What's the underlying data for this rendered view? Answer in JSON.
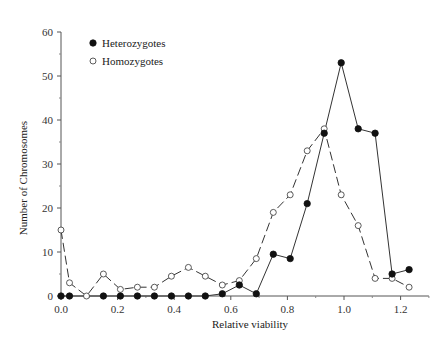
{
  "chart_data": {
    "type": "line",
    "title": "",
    "xlabel": "Relative viability",
    "ylabel": "Number of Chromosomes",
    "xlim": [
      0.0,
      1.3
    ],
    "ylim": [
      0,
      60
    ],
    "x_ticks": [
      0.0,
      0.2,
      0.4,
      0.6,
      0.8,
      1.0,
      1.2
    ],
    "x_tick_labels": [
      "0.0",
      "0.2",
      "0.4",
      "0.6",
      "0.8",
      "1.0",
      "1.2"
    ],
    "y_ticks": [
      0,
      10,
      20,
      30,
      40,
      50,
      60
    ],
    "y_tick_labels": [
      "0",
      "10",
      "20",
      "30",
      "40",
      "50",
      "60"
    ],
    "grid": false,
    "legend_position": "upper-left",
    "series": [
      {
        "name": "Heterozygotes",
        "marker": "filled-circle",
        "line_style": "solid",
        "x": [
          0.0,
          0.03,
          0.15,
          0.21,
          0.27,
          0.33,
          0.39,
          0.45,
          0.51,
          0.57,
          0.63,
          0.69,
          0.75,
          0.81,
          0.87,
          0.93,
          0.99,
          1.05,
          1.11,
          1.17,
          1.23
        ],
        "values": [
          0,
          0,
          0,
          0,
          0,
          0,
          0,
          0,
          0,
          0.5,
          2.5,
          0.5,
          9.5,
          8.5,
          21,
          37,
          53,
          38,
          37,
          5,
          6
        ]
      },
      {
        "name": "Homozygotes",
        "marker": "open-circle",
        "line_style": "dashed",
        "x": [
          0.0,
          0.03,
          0.09,
          0.15,
          0.21,
          0.27,
          0.33,
          0.39,
          0.45,
          0.51,
          0.57,
          0.63,
          0.69,
          0.75,
          0.81,
          0.87,
          0.93,
          0.99,
          1.05,
          1.11,
          1.17,
          1.23
        ],
        "values": [
          15,
          3,
          0,
          5,
          1.5,
          2,
          2,
          4.5,
          6.5,
          4.5,
          2.5,
          3.5,
          8.5,
          19,
          23,
          33,
          38,
          23,
          16,
          4,
          4,
          2
        ]
      }
    ]
  },
  "legend": {
    "items": [
      {
        "label": "Heterozygotes",
        "marker": "filled-circle"
      },
      {
        "label": "Homozygotes",
        "marker": "open-circle"
      }
    ]
  },
  "axes": {
    "xlabel": "Relative viability",
    "ylabel": "Number of Chromosomes"
  }
}
